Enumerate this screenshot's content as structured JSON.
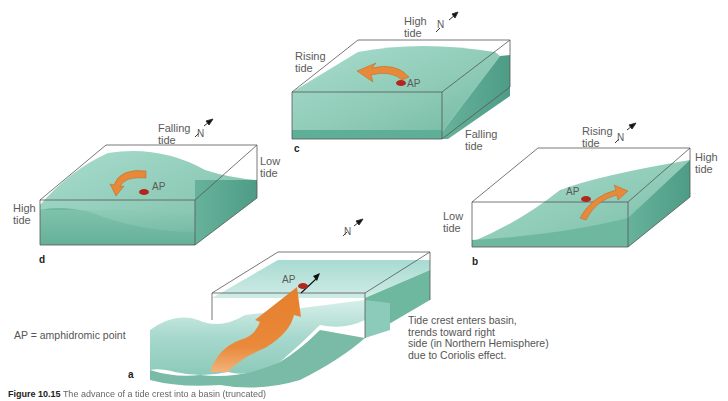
{
  "figure": {
    "caption_label": "Figure 10.15",
    "caption_rest": "The advance of a tide crest into a basin (truncated)",
    "legend_note": "AP = amphidromic point",
    "description": "Tide crest enters basin,\ntrends toward right\nside (in Northern Hemisphere)\ndue to Coriolis effect.",
    "colors": {
      "water_top": "#8ccbb8",
      "water_side": "#5fae97",
      "water_light": "#bfe3dc",
      "arrow": "#e8893a",
      "ap_dot": "#b3261e",
      "outline": "#555555"
    }
  },
  "panels": {
    "a": {
      "letter": "a",
      "ap_label": "AP",
      "north_label": "N"
    },
    "b": {
      "letter": "b",
      "ap_label": "AP",
      "north_label": "N",
      "top_label": "Rising\ntide",
      "right_label": "High\ntide",
      "left_label": "Low\ntide"
    },
    "c": {
      "letter": "c",
      "ap_label": "AP",
      "north_label": "N",
      "top_label": "High\ntide",
      "left_label": "Rising\ntide",
      "right_label": "Falling\ntide"
    },
    "d": {
      "letter": "d",
      "ap_label": "AP",
      "north_label": "N",
      "top_label": "Falling\ntide",
      "right_label": "Low\ntide",
      "left_label": "High\ntide"
    }
  }
}
